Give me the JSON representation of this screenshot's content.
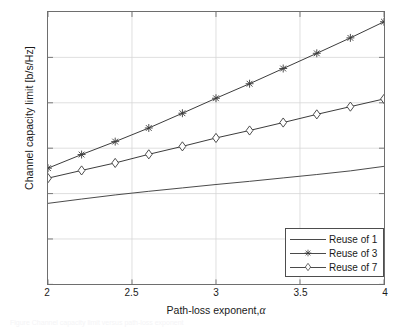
{
  "chart_data": {
    "type": "line",
    "title": "",
    "xlabel": "Path-loss exponent, α",
    "ylabel": "Channel capacity limit [b/s/Hz]",
    "xlim": [
      2,
      4
    ],
    "ylim": [
      0,
      1.2
    ],
    "xticks": [
      "2",
      "2.5",
      "3",
      "3.5",
      "4"
    ],
    "xtick_values": [
      2,
      2.5,
      3,
      3.5,
      4
    ],
    "yticks": [
      "0",
      "0.2",
      "0.4",
      "0.6",
      "0.8",
      "1"
    ],
    "ytick_values": [
      0,
      0.2,
      0.4,
      0.6,
      0.8,
      1
    ],
    "grid": true,
    "legend_position": "lower right",
    "x": [
      2,
      2.2,
      2.4,
      2.6,
      2.8,
      3.0,
      3.2,
      3.4,
      3.6,
      3.8,
      4.0
    ],
    "series": [
      {
        "name": "Reuse of 1",
        "marker": "none",
        "color": "#4a4a4a",
        "values": [
          0.357,
          0.376,
          0.394,
          0.41,
          0.425,
          0.44,
          0.454,
          0.469,
          0.484,
          0.5,
          0.52
        ]
      },
      {
        "name": "Reuse of 3",
        "marker": "star",
        "color": "#3a3a3a",
        "values": [
          0.512,
          0.572,
          0.629,
          0.689,
          0.754,
          0.82,
          0.884,
          0.951,
          1.018,
          1.086,
          1.157
        ]
      },
      {
        "name": "Reuse of 7",
        "marker": "diamond",
        "color": "#3a3a3a",
        "values": [
          0.468,
          0.502,
          0.535,
          0.573,
          0.608,
          0.645,
          0.678,
          0.713,
          0.749,
          0.783,
          0.817
        ]
      }
    ]
  },
  "legend": {
    "items": [
      {
        "label": "Reuse of 1",
        "marker": "none"
      },
      {
        "label": "Reuse of 3",
        "marker": "star"
      },
      {
        "label": "Reuse of 7",
        "marker": "diamond"
      }
    ]
  },
  "axes": {
    "x_label_text": "Path-loss exponent,",
    "x_label_symbol": "α",
    "y_label_text": "Channel capacity limit [b/s/Hz]"
  },
  "caption_ghost": "Figure  Channel capacity limit versus path-loss exponent"
}
